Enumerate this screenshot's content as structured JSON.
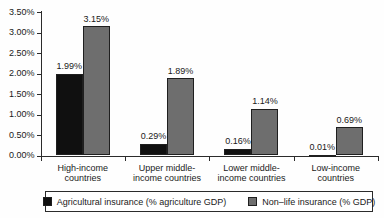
{
  "chart_data": {
    "type": "bar",
    "title": "",
    "xlabel": "",
    "ylabel": "",
    "grid": false,
    "legend_position": "bottom",
    "ylim": [
      0,
      3.5
    ],
    "yticks": [
      "0.00%",
      "0.50%",
      "1.00%",
      "1.50%",
      "2.00%",
      "2.50%",
      "3.00%",
      "3.50%"
    ],
    "categories": [
      "High-income\ncountries",
      "Upper middle-\nincome countries",
      "Lower middle-\nincome countries",
      "Low-income\ncountries"
    ],
    "series": [
      {
        "key": "agricultural-insurance",
        "name": "Agricultural insurance (% agriculture GDP)",
        "color": "#101010",
        "values": [
          1.99,
          0.29,
          0.16,
          0.01
        ],
        "labels": [
          "1.99%",
          "0.29%",
          "0.16%",
          "0.01%"
        ]
      },
      {
        "key": "nonlife-insurance",
        "name": "Non–life insurance (% GDP)",
        "color": "#6e6e6e",
        "values": [
          3.15,
          1.89,
          1.14,
          0.69
        ],
        "labels": [
          "3.15%",
          "1.89%",
          "1.14%",
          "0.69%"
        ]
      }
    ]
  }
}
